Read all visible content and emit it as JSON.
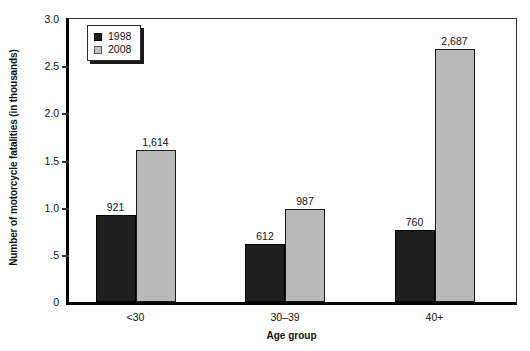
{
  "chart_data": {
    "type": "bar",
    "title": "",
    "xlabel": "Age group",
    "ylabel": "Number of motorcycle fatalities (in thousands)",
    "categories": [
      "<30",
      "30–39",
      "40+"
    ],
    "series": [
      {
        "name": "1998",
        "color": "#1f1f1f",
        "values": [
          0.921,
          0.612,
          0.76
        ],
        "labels": [
          "921",
          "612",
          "760"
        ]
      },
      {
        "name": "2008",
        "color": "#b9b9b9",
        "values": [
          1.614,
          0.987,
          2.687
        ],
        "labels": [
          "1,614",
          "987",
          "2,687"
        ]
      }
    ],
    "ylim": [
      0,
      3.0
    ],
    "yticks": [
      0,
      0.5,
      1.0,
      1.5,
      2.0,
      2.5,
      3.0
    ],
    "ytick_labels": [
      "0",
      ".5",
      "1.0",
      "1.5",
      "2.0",
      "2.5",
      "3.0"
    ],
    "grid": false,
    "legend_position": "top-left",
    "legend_entries": [
      "1998",
      "2008"
    ]
  }
}
